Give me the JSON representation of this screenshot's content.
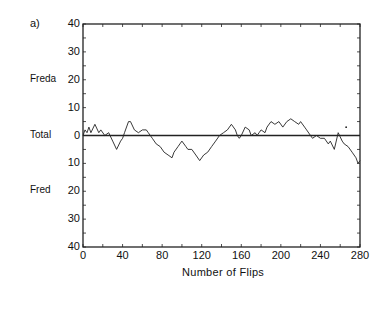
{
  "panel_label": "a)",
  "chart_data": {
    "type": "line",
    "title": "",
    "xlabel": "Number of Flips",
    "ylabel": "",
    "xlim": [
      0,
      280
    ],
    "ylim": [
      -40,
      40
    ],
    "x_ticks": [
      0,
      40,
      80,
      120,
      160,
      200,
      240,
      280
    ],
    "y_ticks": [
      {
        "value": 40,
        "label": "40"
      },
      {
        "value": 30,
        "label": "30"
      },
      {
        "value": 20,
        "label": "20"
      },
      {
        "value": 10,
        "label": "10"
      },
      {
        "value": 0,
        "label": "0"
      },
      {
        "value": -10,
        "label": "10"
      },
      {
        "value": -20,
        "label": "20"
      },
      {
        "value": -30,
        "label": "30"
      },
      {
        "value": -40,
        "label": "40"
      }
    ],
    "side_labels": [
      {
        "value": 20,
        "label": "Freda"
      },
      {
        "value": 0,
        "label": "Total"
      },
      {
        "value": -20,
        "label": "Fred"
      }
    ],
    "reference_line": 0,
    "grid": false,
    "annotations": [
      {
        "x": 266,
        "y": 3,
        "label": "•"
      }
    ],
    "series": [
      {
        "name": "Lead (positive = Freda ahead, negative = Fred ahead)",
        "x": [
          0,
          2,
          4,
          6,
          8,
          12,
          16,
          18,
          22,
          26,
          30,
          34,
          38,
          40,
          42,
          46,
          48,
          52,
          56,
          60,
          64,
          66,
          70,
          74,
          78,
          82,
          86,
          90,
          92,
          96,
          98,
          100,
          104,
          106,
          110,
          114,
          118,
          122,
          126,
          130,
          134,
          138,
          142,
          146,
          150,
          154,
          156,
          158,
          160,
          164,
          168,
          170,
          174,
          176,
          178,
          180,
          184,
          186,
          190,
          194,
          198,
          202,
          206,
          210,
          214,
          218,
          220,
          224,
          226,
          230,
          232,
          236,
          240,
          244,
          248,
          250,
          254,
          258,
          262,
          264,
          268,
          272,
          276,
          278,
          280
        ],
        "values": [
          0,
          2,
          1,
          3,
          1,
          4,
          1,
          2,
          0,
          1,
          -2,
          -5,
          -2,
          -1,
          1,
          5,
          5,
          2,
          1,
          2,
          2,
          1,
          -1,
          -3,
          -4,
          -6,
          -7,
          -8,
          -6,
          -4,
          -3,
          -2,
          -4,
          -5,
          -5,
          -7,
          -9,
          -7,
          -6,
          -4,
          -2,
          0,
          1,
          2,
          4,
          2,
          0,
          -1,
          0,
          3,
          2,
          0,
          1,
          0,
          1,
          2,
          1,
          3,
          5,
          4,
          5,
          3,
          5,
          6,
          5,
          4,
          5,
          3,
          2,
          0,
          -1,
          0,
          -1,
          -1,
          -3,
          -2,
          -5,
          1,
          -2,
          -3,
          -4,
          -6,
          -8,
          -10,
          -9
        ]
      }
    ]
  }
}
